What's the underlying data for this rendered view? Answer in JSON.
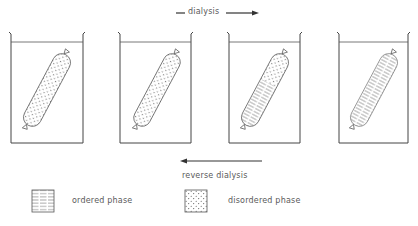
{
  "figure": {
    "type": "diagram",
    "top_arrow": {
      "label": "dialysis",
      "direction": "right"
    },
    "bottom_arrow": {
      "label": "reverse dialysis",
      "direction": "left"
    },
    "beakers": [
      {
        "index": 1,
        "bag_fill": "disordered",
        "ordered_fraction": 0.0
      },
      {
        "index": 2,
        "bag_fill": "disordered",
        "ordered_fraction": 0.05
      },
      {
        "index": 3,
        "bag_fill": "mixed",
        "ordered_fraction": 0.6
      },
      {
        "index": 4,
        "bag_fill": "ordered",
        "ordered_fraction": 1.0
      }
    ],
    "legend": [
      {
        "key": "ordered",
        "pattern": "horizontal-lines",
        "label": "ordered phase"
      },
      {
        "key": "disordered",
        "pattern": "dots",
        "label": "disordered phase"
      }
    ],
    "colors": {
      "line": "#4a4a4a",
      "text": "#5a5a5a",
      "background": "#ffffff"
    }
  }
}
